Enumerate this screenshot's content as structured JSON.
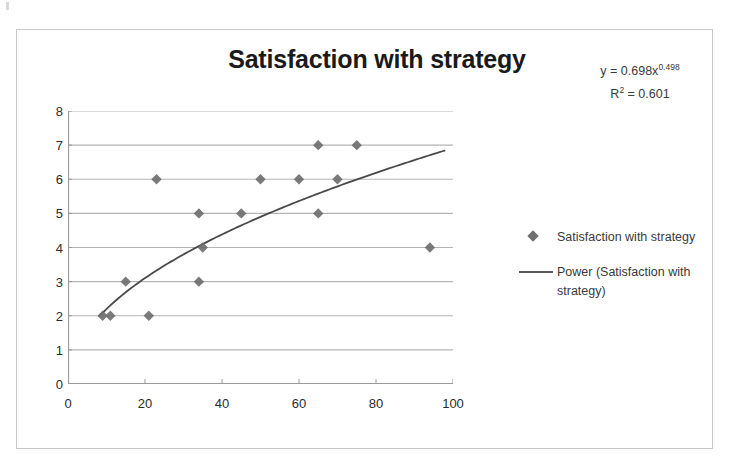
{
  "chart_data": {
    "type": "scatter",
    "title": "Satisfaction with strategy",
    "xlabel": "",
    "ylabel": "",
    "xlim": [
      0,
      100
    ],
    "ylim": [
      0,
      8
    ],
    "xticks": [
      0,
      20,
      40,
      60,
      80,
      100
    ],
    "yticks": [
      0,
      1,
      2,
      3,
      4,
      5,
      6,
      7,
      8
    ],
    "grid": "horizontal",
    "legend_position": "right",
    "series": [
      {
        "name": "Satisfaction with strategy",
        "marker": "diamond",
        "color": "#6f6f6f",
        "points": [
          {
            "x": 9,
            "y": 2
          },
          {
            "x": 11,
            "y": 2
          },
          {
            "x": 15,
            "y": 3
          },
          {
            "x": 21,
            "y": 2
          },
          {
            "x": 23,
            "y": 6
          },
          {
            "x": 34,
            "y": 3
          },
          {
            "x": 34,
            "y": 5
          },
          {
            "x": 35,
            "y": 4
          },
          {
            "x": 45,
            "y": 5
          },
          {
            "x": 50,
            "y": 6
          },
          {
            "x": 60,
            "y": 6
          },
          {
            "x": 65,
            "y": 5
          },
          {
            "x": 65,
            "y": 7
          },
          {
            "x": 70,
            "y": 6
          },
          {
            "x": 75,
            "y": 7
          },
          {
            "x": 94,
            "y": 4
          }
        ]
      },
      {
        "name": "Power (Satisfaction with strategy)",
        "type": "trendline",
        "fit": "power",
        "color": "#4a4a4a",
        "coefficient": 0.698,
        "exponent": 0.498,
        "r_squared": 0.601,
        "x_range": [
          8,
          98
        ]
      }
    ],
    "annotations": {
      "equation_prefix": "y = 0.698x",
      "equation_exponent": "0.498",
      "r_squared_prefix": "R",
      "r_squared_sup": "2",
      "r_squared_value": " = 0.601"
    }
  },
  "legend": {
    "entries": [
      {
        "label": "Satisfaction with strategy",
        "key": "diamond-marker"
      },
      {
        "label": "Power (Satisfaction with strategy)",
        "key": "line-marker"
      }
    ]
  }
}
